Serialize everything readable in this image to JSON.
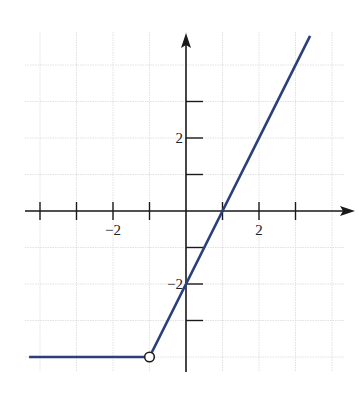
{
  "chart_data": {
    "type": "line",
    "title": "",
    "xlabel": "",
    "ylabel": "",
    "xlim": [
      -4.3,
      4.6
    ],
    "ylim": [
      -4.3,
      5
    ],
    "grid": true,
    "x_tick_labels": [
      {
        "value": -2,
        "label": "−2"
      },
      {
        "value": 2,
        "label": "2"
      }
    ],
    "y_tick_labels": [
      {
        "value": 2,
        "label": "2"
      },
      {
        "value": -2,
        "label": "−2"
      }
    ],
    "x_ticks": [
      -4,
      -3,
      -2,
      -1,
      1,
      2,
      3
    ],
    "y_ticks": [
      -3,
      -2,
      -1,
      1,
      2,
      3
    ],
    "series": [
      {
        "name": "constant piece",
        "points": [
          [
            -4.3,
            -4
          ],
          [
            -1,
            -4
          ]
        ],
        "description": "y = -4 for x < -1"
      },
      {
        "name": "linear piece",
        "points": [
          [
            -1,
            -4
          ],
          [
            3.4,
            4.8
          ]
        ],
        "description": "y = 2x - 2 for x > -1"
      }
    ],
    "annotations": [
      {
        "type": "open-circle",
        "x": -1,
        "y": -4
      }
    ],
    "colors": {
      "line": "#2b3f7a",
      "axis": "#1a1a1a",
      "grid": "#d9d9d9"
    }
  }
}
